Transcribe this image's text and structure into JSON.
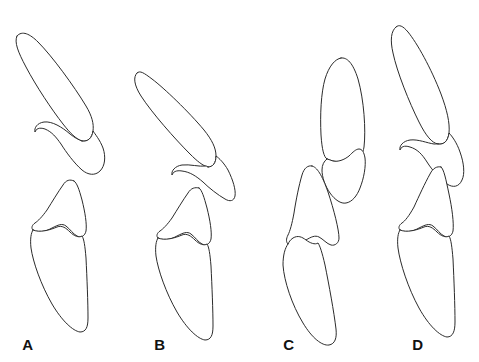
{
  "figure": {
    "background_color": "#ffffff",
    "stroke_color": "#2b2b2b",
    "stroke_width": 1,
    "width": 479,
    "height": 362,
    "panel_count": 4,
    "panels": [
      {
        "label": "A",
        "label_x": 28,
        "label_y": 350,
        "description": "Upper and lower tooth outlines, steeply inclined, upper crown long and narrow with posterior cusp, lower crown with cusp and elongate root",
        "element_count": 4,
        "elements": [
          {
            "name": "upper-anterior-crown",
            "kind": "crown-outline"
          },
          {
            "name": "upper-posterior-cusp",
            "kind": "cusp-outline"
          },
          {
            "name": "lower-cusp",
            "kind": "cusp-outline"
          },
          {
            "name": "lower-root",
            "kind": "root-outline"
          }
        ]
      },
      {
        "label": "B",
        "label_x": 160,
        "label_y": 350,
        "description": "Upper tooth rotated toward horizontal, crown tip directed upper-left, posterior cusp extending lower-right; lower tooth inclined",
        "element_count": 4,
        "elements": [
          {
            "name": "upper-anterior-crown",
            "kind": "crown-outline"
          },
          {
            "name": "upper-posterior-cusp",
            "kind": "cusp-outline"
          },
          {
            "name": "lower-cusp",
            "kind": "cusp-outline"
          },
          {
            "name": "lower-root",
            "kind": "root-outline"
          }
        ]
      },
      {
        "label": "C",
        "label_x": 289,
        "label_y": 350,
        "description": "Upper tooth near vertical with rounded apex; cusp element alongside; lower cusp and root offset to the left",
        "element_count": 4,
        "elements": [
          {
            "name": "upper-anterior-crown",
            "kind": "crown-outline"
          },
          {
            "name": "upper-posterior-cusp",
            "kind": "cusp-outline"
          },
          {
            "name": "lower-cusp",
            "kind": "cusp-outline"
          },
          {
            "name": "lower-root",
            "kind": "root-outline"
          }
        ]
      },
      {
        "label": "D",
        "label_x": 418,
        "label_y": 350,
        "description": "Upper and lower teeth aligned in a near-vertical column, tightly stacked with interlocking cusps",
        "element_count": 4,
        "elements": [
          {
            "name": "upper-anterior-crown",
            "kind": "crown-outline"
          },
          {
            "name": "upper-posterior-cusp",
            "kind": "cusp-outline"
          },
          {
            "name": "lower-cusp",
            "kind": "cusp-outline"
          },
          {
            "name": "lower-root",
            "kind": "root-outline"
          }
        ]
      }
    ],
    "labels": {
      "a": "A",
      "b": "B",
      "c": "C",
      "d": "D"
    },
    "paths": {
      "a_upper_crown": "M17,36 C14,42 18,52 26,67 C36,86 52,110 63,124 C70,133 76,139 82,141 C88,142 92,138 93,131 C94,124 92,116 86,106 C74,86 52,56 38,42 C30,34 22,30 17,36 Z",
      "a_upper_cusp": "M82,141 C88,142 92,138 93,131 C95,134 100,140 103,148 C106,157 105,166 100,171 C95,176 88,175 82,170 C74,163 66,152 61,144 C56,137 52,132 45,129 C39,127 36,129 35,132 C34,128 37,123 44,122 C52,121 62,127 70,134 C75,138 79,140 82,141 Z",
      "a_lower_cusp": "M74,181 C70,179 66,180 63,185 C58,192 52,202 47,210 C42,217 38,221 35,223 C32,225 31,228 33,230 C37,233 45,232 52,228 C58,225 62,223 66,226 C70,229 73,234 77,236 C81,238 85,236 86,231 C87,224 85,212 82,200 C79,189 77,183 74,181 Z",
      "a_lower_root": "M33,230 C31,233 30,239 31,248 C33,262 41,285 52,304 C62,321 73,331 80,332 C86,332 88,327 88,318 C88,303 87,278 86,258 C85,246 84,239 82,236 C79,238 74,236 70,232 C66,228 62,225 57,227 C50,230 40,233 33,230 Z",
      "b_upper_crown": "M137,73 C133,77 134,85 141,96 C152,113 175,139 190,154 C197,161 203,166 208,167 C213,167 216,163 216,156 C216,148 212,140 204,130 C189,112 164,88 152,79 C144,73 140,70 137,73 Z",
      "b_upper_cusp": "M208,167 C213,167 216,163 216,156 C219,158 224,163 228,170 C233,180 236,190 235,196 C234,201 230,202 225,199 C218,195 209,188 203,182 C196,176 190,172 182,171 C176,170 173,172 172,175 C171,171 175,166 182,165 C190,164 199,167 206,166 C207,166 208,167 208,167 Z",
      "b_lower_cusp": "M199,188 C195,187 191,188 188,193 C183,200 177,210 172,218 C167,225 163,229 160,231 C157,233 156,236 158,238 C162,241 170,240 177,236 C183,233 187,231 191,234 C195,237 198,242 202,244 C206,246 210,244 211,239 C212,232 210,220 207,208 C204,197 202,190 199,188 Z",
      "b_lower_root": "M158,238 C156,241 155,247 156,256 C158,270 166,293 177,312 C187,329 198,339 205,340 C211,340 213,335 213,326 C213,311 212,286 211,266 C210,254 209,247 207,244 C204,246 199,244 195,240 C191,236 187,233 182,235 C175,238 165,241 158,238 Z",
      "c_upper_crown": "M341,58 C335,59 329,66 325,79 C321,93 320,115 321,135 C322,150 324,157 327,159 C333,162 344,163 353,160 C360,158 363,154 364,147 C366,130 364,100 358,79 C353,63 347,57 341,58 Z",
      "c_upper_cusp": "M327,159 C324,161 322,165 322,170 C322,177 325,186 330,193 C335,200 341,204 346,203 C352,202 357,196 360,188 C364,178 366,166 365,158 C364,152 362,149 359,149 C356,149 353,152 349,156 C344,160 338,162 333,161 C330,160 328,159 327,159 Z",
      "c_lower_cusp": "M312,166 C308,165 304,168 302,175 C299,185 296,200 294,213 C292,224 290,231 288,235 C286,239 286,242 288,244 C292,246 300,244 306,240 C311,237 315,235 319,237 C323,239 327,244 331,245 C335,246 339,243 339,238 C339,230 334,210 328,192 C322,175 317,167 312,166 Z",
      "c_lower_root": "M288,244 C285,248 283,255 283,265 C284,281 292,305 303,323 C312,338 322,346 329,345 C335,344 337,338 336,329 C334,312 329,285 325,265 C322,252 320,246 318,243 C315,245 310,243 306,240 C302,237 298,235 293,238 C290,240 289,242 288,244 Z",
      "d_upper_crown": "M396,27 C391,31 390,40 393,53 C397,72 409,102 419,122 C426,136 432,143 438,144 C444,145 448,141 449,133 C450,123 447,110 441,94 C431,68 417,43 408,32 C403,26 399,24 396,27 Z",
      "d_upper_cusp": "M438,144 C444,145 448,141 449,133 C452,136 457,143 460,152 C464,163 465,174 462,180 C459,187 453,188 447,184 C440,179 432,170 427,162 C422,154 417,149 410,147 C404,145 401,147 400,150 C399,146 403,141 410,140 C418,139 427,143 434,144 C436,144 437,144 438,144 Z",
      "d_lower_cusp": "M441,167 C437,166 433,168 430,174 C425,183 419,196 414,207 C409,216 405,221 402,223 C399,225 398,228 400,230 C404,233 412,232 419,228 C425,225 429,223 433,226 C437,229 440,234 444,236 C448,238 452,236 453,231 C454,223 452,208 449,194 C446,180 444,169 441,167 Z",
      "d_lower_root": "M400,230 C398,233 397,239 398,248 C400,263 408,288 419,308 C429,326 440,336 447,337 C453,337 455,331 455,322 C455,306 454,280 453,259 C452,247 451,239 449,236 C446,238 441,236 437,232 C433,228 429,225 424,227 C417,230 407,233 400,230 Z"
    }
  }
}
